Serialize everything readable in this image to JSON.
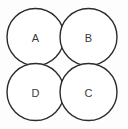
{
  "diagram": {
    "canvas": {
      "width": 128,
      "height": 129,
      "background_color": "#fdfdfd"
    },
    "style": {
      "circle_fill": "#ffffff",
      "circle_stroke": "#2b2b2b",
      "circle_stroke_width": 1.4,
      "label_color": "#3a3a3a",
      "label_font_size": 11
    },
    "circles": [
      {
        "id": "circle-a",
        "label": "A",
        "position": "top-left",
        "cx": 35.5,
        "cy": 37,
        "r": 28.5,
        "label_x": 35.5,
        "label_y": 37.5
      },
      {
        "id": "circle-b",
        "label": "B",
        "position": "top-right",
        "cx": 88.5,
        "cy": 37,
        "r": 28.5,
        "label_x": 88.5,
        "label_y": 37.5
      },
      {
        "id": "circle-d",
        "label": "D",
        "position": "bottom-left",
        "cx": 35.5,
        "cy": 92,
        "r": 28.5,
        "label_x": 35.5,
        "label_y": 92.5
      },
      {
        "id": "circle-c",
        "label": "C",
        "position": "bottom-right",
        "cx": 88.5,
        "cy": 92,
        "r": 28.5,
        "label_x": 88.5,
        "label_y": 92.5
      }
    ]
  }
}
